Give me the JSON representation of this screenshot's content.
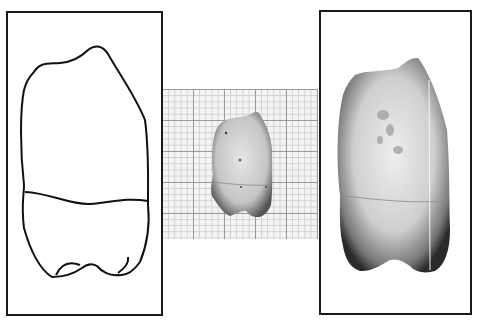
{
  "figure": {
    "panels": [
      {
        "id": "left",
        "kind": "line-drawing",
        "subject": "tooth outline (crown and root division)"
      },
      {
        "id": "center",
        "kind": "photograph-on-graph-paper",
        "subject": "tooth specimen at scale"
      },
      {
        "id": "right",
        "kind": "enlarged-photograph",
        "subject": "tooth specimen magnified"
      }
    ],
    "colors": {
      "frame": "#1a1a1a",
      "grid_major": "#9a9a9a",
      "grid_minor": "#cfcfcf",
      "background": "#ffffff"
    }
  }
}
